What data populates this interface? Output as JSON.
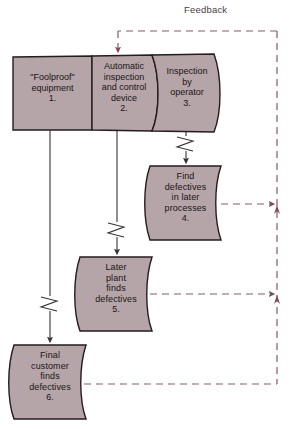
{
  "diagram": {
    "colors": {
      "node_fill": "#b5a5a8",
      "node_stroke": "#241c1f",
      "solid_line": "#3a3034",
      "dashed_line": "#8a5a64",
      "background": "#ffffff",
      "text": "#1a1416"
    },
    "feedback_label": "Feedback",
    "top_bar": {
      "name": "inspection-bar",
      "cells": [
        {
          "id": "cell-1",
          "text": "\"Foolproof\"\nequipment\n1.",
          "number": "1."
        },
        {
          "id": "cell-2",
          "text": "Automatic\ninspection\nand control\ndevice\n2.",
          "number": "2."
        },
        {
          "id": "cell-3",
          "text": "Inspection\nby\noperator\n3.",
          "number": "3."
        }
      ]
    },
    "nodes": [
      {
        "id": "node-4",
        "text": "Find\ndefectives\nin later\nprocesses\n4.",
        "number": "4."
      },
      {
        "id": "node-5",
        "text": "Later\nplant\nfinds\ndefectives\n5.",
        "number": "5."
      },
      {
        "id": "node-6",
        "text": "Final\ncustomer\nfinds\ndefectives\n6.",
        "number": "6."
      }
    ]
  }
}
